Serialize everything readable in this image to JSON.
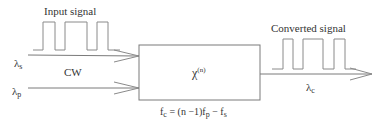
{
  "labels": {
    "input_signal": "Input signal",
    "converted_signal": "Converted signal",
    "cw": "CW",
    "lambda_s": {
      "base": "λ",
      "sub": "s"
    },
    "lambda_p": {
      "base": "λ",
      "sub": "p"
    },
    "lambda_c": {
      "base": "λ",
      "sub": "c"
    },
    "chi": {
      "base": "χ",
      "sup": "(n)"
    },
    "formula": {
      "f_c": "f",
      "c": "c",
      "eq": " = (n −1)f",
      "p": "p",
      "minus": " − f",
      "s": "s"
    }
  },
  "colors": {
    "stroke": "#7a7a7a",
    "text": "#333333"
  }
}
